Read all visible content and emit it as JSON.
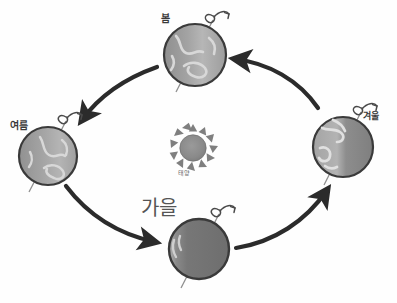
{
  "diagram": {
    "center": {
      "name": "sun",
      "label": "태양",
      "cx": 193,
      "cy": 148,
      "radius": 13,
      "ray_count": 12,
      "color": "#8a8a8a"
    },
    "orbit": {
      "cx": 196,
      "cy": 152,
      "rx": 152,
      "ry": 100,
      "direction": "counter-clockwise",
      "visible": false
    },
    "earths": [
      {
        "id": "spring",
        "label": "봄",
        "cx": 195,
        "cy": 55,
        "radius": 31,
        "lit_side": "left",
        "shade": "light",
        "axis_tilt_deg": 23,
        "rotation_symbol": "spin-curl",
        "color": "#9a9a9a"
      },
      {
        "id": "summer",
        "label": "여름",
        "cx": 48,
        "cy": 156,
        "radius": 29,
        "lit_side": "right",
        "shade": "light",
        "axis_tilt_deg": 23,
        "rotation_symbol": "spin-curl",
        "color": "#9a9a9a"
      },
      {
        "id": "autumn",
        "label": "가을",
        "cx": 199,
        "cy": 249,
        "radius": 30,
        "lit_side": "left-sliver",
        "shade": "dark",
        "axis_tilt_deg": 23,
        "rotation_symbol": "spin-curl",
        "color": "#7b7b7b"
      },
      {
        "id": "winter",
        "label": "겨울",
        "cx": 343,
        "cy": 147,
        "radius": 30,
        "lit_side": "left",
        "shade": "medium",
        "axis_tilt_deg": 23,
        "rotation_symbol": "spin-curl",
        "color": "#8d8d8d"
      }
    ],
    "arrows": [
      {
        "id": "spring-to-summer",
        "from": "spring",
        "to": "summer",
        "head": "down-left"
      },
      {
        "id": "summer-to-autumn",
        "from": "summer",
        "to": "autumn",
        "head": "down-right"
      },
      {
        "id": "autumn-to-winter",
        "from": "autumn",
        "to": "winter",
        "head": "up-right"
      },
      {
        "id": "winter-to-spring",
        "from": "winter",
        "to": "spring",
        "head": "up-left"
      }
    ],
    "colors": {
      "ink": "#2b2b2b",
      "paper": "#fefefe",
      "earth_light": "#a8a8a8",
      "earth_dark": "#6f6f6f",
      "sun": "#8a8a8a",
      "text": "#3a3a3a"
    }
  }
}
